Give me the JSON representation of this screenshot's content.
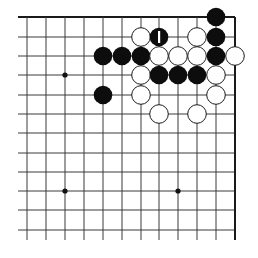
{
  "diagram": {
    "title": "",
    "board": {
      "corner": "top-right",
      "columns": 12,
      "rows": 12,
      "col_x": [
        27,
        46,
        65,
        84,
        103,
        122,
        141,
        159,
        178,
        197,
        216,
        235
      ],
      "row_y": [
        17,
        37,
        56,
        75,
        95,
        114,
        133,
        153,
        172,
        191,
        210,
        230
      ],
      "edges": {
        "top": true,
        "right": true,
        "left": false,
        "bottom": false
      },
      "line_extend": {
        "left_start_x": 18,
        "bottom_end_y": 240
      },
      "stone_radius": 9.3,
      "colors": {
        "black": "#0d0d0d",
        "white": "#ffffff",
        "line": "#3a3a3a"
      }
    },
    "star_points": [
      {
        "col": 2,
        "row": 3
      },
      {
        "col": 2,
        "row": 9
      },
      {
        "col": 8,
        "row": 9
      }
    ],
    "stones": [
      {
        "color": "black",
        "col": 10,
        "row": 0
      },
      {
        "color": "white",
        "col": 6,
        "row": 1
      },
      {
        "color": "black",
        "col": 7,
        "row": 1,
        "label": "1"
      },
      {
        "color": "white",
        "col": 9,
        "row": 1
      },
      {
        "color": "black",
        "col": 10,
        "row": 1
      },
      {
        "color": "black",
        "col": 4,
        "row": 2
      },
      {
        "color": "black",
        "col": 5,
        "row": 2
      },
      {
        "color": "black",
        "col": 6,
        "row": 2
      },
      {
        "color": "white",
        "col": 7,
        "row": 2
      },
      {
        "color": "white",
        "col": 8,
        "row": 2
      },
      {
        "color": "white",
        "col": 9,
        "row": 2
      },
      {
        "color": "black",
        "col": 10,
        "row": 2
      },
      {
        "color": "white",
        "col": 11,
        "row": 2
      },
      {
        "color": "white",
        "col": 6,
        "row": 3
      },
      {
        "color": "black",
        "col": 7,
        "row": 3
      },
      {
        "color": "black",
        "col": 8,
        "row": 3
      },
      {
        "color": "black",
        "col": 9,
        "row": 3
      },
      {
        "color": "white",
        "col": 10,
        "row": 3
      },
      {
        "color": "black",
        "col": 4,
        "row": 4
      },
      {
        "color": "white",
        "col": 6,
        "row": 4
      },
      {
        "color": "white",
        "col": 10,
        "row": 4
      },
      {
        "color": "white",
        "col": 7,
        "row": 5
      },
      {
        "color": "white",
        "col": 9,
        "row": 5
      }
    ],
    "move_labels": [
      {
        "text": "1",
        "col": 7,
        "row": 1,
        "on": "black"
      }
    ]
  }
}
